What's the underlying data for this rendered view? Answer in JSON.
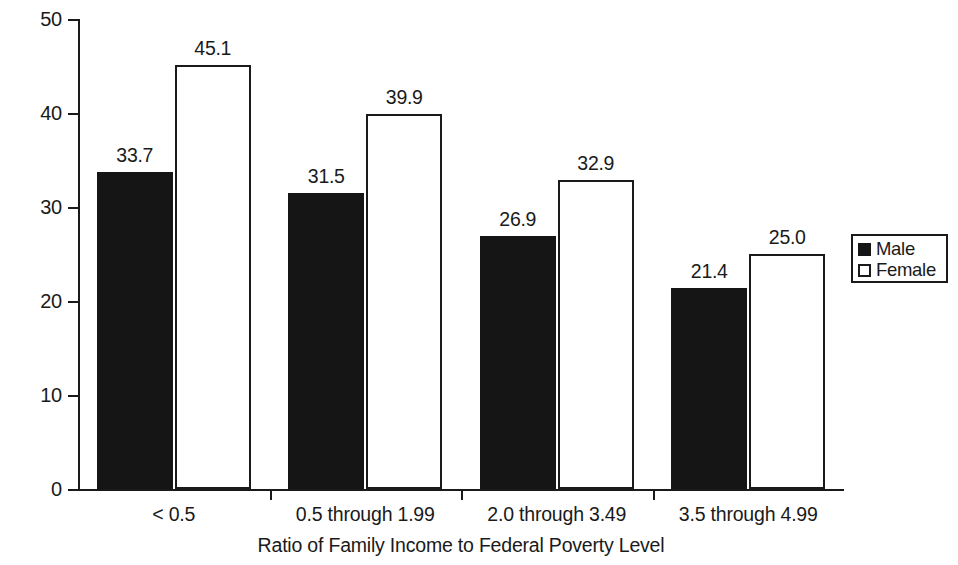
{
  "chart_data": {
    "type": "bar",
    "title": "",
    "subtitle": "",
    "xlabel": "Ratio of Family Income to Federal Poverty Level",
    "ylabel": "Total Pecentage Poor Mental Health",
    "categories": [
      "< 0.5",
      "0.5 through 1.99",
      "2.0 through 3.49",
      "3.5 through 4.99"
    ],
    "series": [
      {
        "name": "Male",
        "values": [
          33.7,
          31.5,
          26.9,
          21.4
        ],
        "color": "#151515",
        "fill": "solid-black"
      },
      {
        "name": "Female",
        "values": [
          45.1,
          39.9,
          32.9,
          25.0
        ],
        "color": "#ffffff",
        "fill": "white-outlined"
      }
    ],
    "value_labels": {
      "male": [
        "33.7",
        "31.5",
        "26.9",
        "21.4"
      ],
      "female": [
        "45.1",
        "39.9",
        "32.9",
        "25.0"
      ]
    },
    "ylim": [
      0,
      50
    ],
    "ytick_values": [
      0,
      10,
      20,
      30,
      40,
      50
    ],
    "ytick_labels": [
      "0",
      "10",
      "20",
      "30",
      "40",
      "50"
    ],
    "grid": false,
    "legend_position": "right",
    "legend_entries": [
      "Male",
      "Female"
    ],
    "axis_color": "#1a1a1a",
    "background_color": "#ffffff"
  },
  "axes": {
    "y_title": "Total Pecentage Poor Mental Health",
    "x_title": "Ratio of Family Income to Federal Poverty Level"
  },
  "legend": {
    "items": [
      {
        "label": "Male",
        "swatch": "filled-black-square"
      },
      {
        "label": "Female",
        "swatch": "open-white-square"
      }
    ]
  }
}
